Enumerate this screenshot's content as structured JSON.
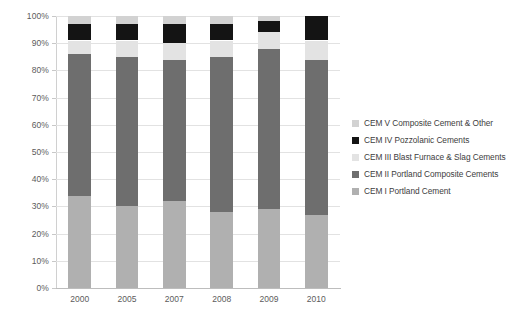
{
  "chart_data": {
    "type": "bar",
    "subtype": "100% stacked column",
    "title": "",
    "xlabel": "",
    "ylabel": "",
    "categories": [
      "2000",
      "2005",
      "2007",
      "2008",
      "2009",
      "2010"
    ],
    "ylim": [
      0,
      100
    ],
    "ytick_labels": [
      "0%",
      "10%",
      "20%",
      "30%",
      "40%",
      "50%",
      "60%",
      "70%",
      "80%",
      "90%",
      "100%"
    ],
    "ytick_values": [
      0,
      10,
      20,
      30,
      40,
      50,
      60,
      70,
      80,
      90,
      100
    ],
    "grid": true,
    "legend_position": "right",
    "legend_order": "reversed",
    "series": [
      {
        "name": "CEM I Portland Cement",
        "color": "#b0b0b0",
        "values": [
          34,
          30,
          32,
          28,
          29,
          27
        ]
      },
      {
        "name": "CEM II Portland Composite Cements",
        "color": "#6e6e6e",
        "values": [
          52,
          55,
          52,
          57,
          59,
          57
        ]
      },
      {
        "name": "CEM III Blast Furnace & Slag Cements",
        "color": "#e3e3e3",
        "values": [
          5,
          6,
          6,
          6,
          6,
          7
        ]
      },
      {
        "name": "CEM IV Pozzolanic Cements",
        "color": "#141414",
        "values": [
          6,
          6,
          7,
          6,
          4,
          9
        ]
      },
      {
        "name": "CEM V Composite Cement & Other",
        "color": "#d2d2d2",
        "values": [
          3,
          3,
          3,
          3,
          2,
          0
        ]
      }
    ]
  },
  "legend": {
    "items": [
      {
        "label": "CEM V Composite Cement & Other",
        "color": "#d2d2d2",
        "icon": "legend-swatch-icon"
      },
      {
        "label": "CEM IV Pozzolanic Cements",
        "color": "#141414",
        "icon": "legend-swatch-icon"
      },
      {
        "label": "CEM III Blast Furnace & Slag Cements",
        "color": "#e3e3e3",
        "icon": "legend-swatch-icon"
      },
      {
        "label": "CEM II Portland Composite Cements",
        "color": "#6e6e6e",
        "icon": "legend-swatch-icon"
      },
      {
        "label": "CEM I Portland Cement",
        "color": "#b0b0b0",
        "icon": "legend-swatch-icon"
      }
    ]
  },
  "colors": {
    "background": "#ffffff",
    "gridline": "#e2e2e2",
    "axis": "#bdbdbd",
    "tick_text": "#5c5c5c",
    "legend_text": "#3d3d3d"
  }
}
